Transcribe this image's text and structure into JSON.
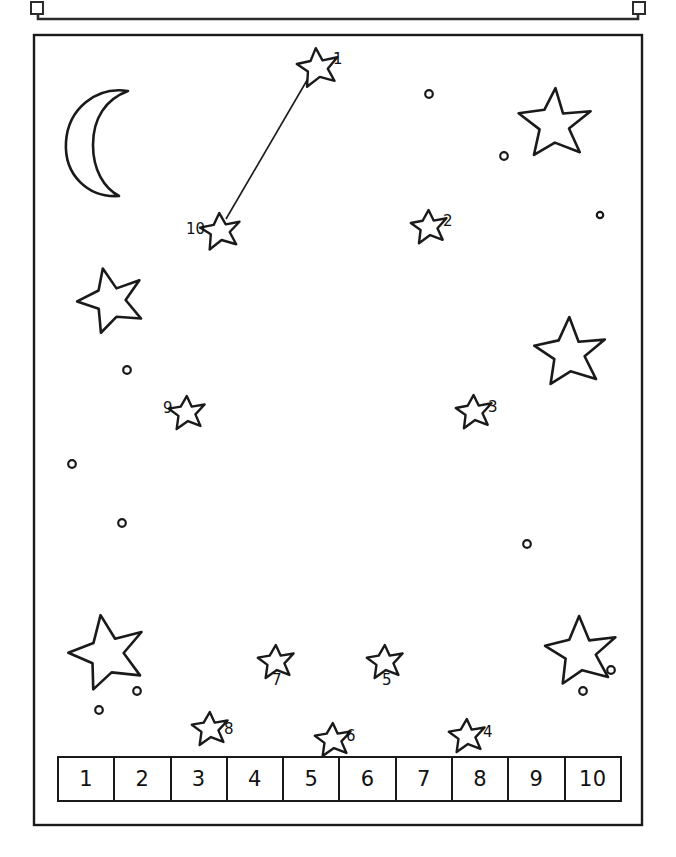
{
  "page": {
    "kind": "connect-the-dots-worksheet",
    "background_color": "#ffffff",
    "ink_color": "#1a1a1a",
    "top_partial_frame": {
      "visible": true,
      "description": "cut-off rectangle edge with small square corner brackets"
    },
    "worksheet_border": {
      "x": 33,
      "y": 34,
      "width": 610,
      "height": 792
    }
  },
  "decorations": {
    "moon": {
      "name": "crescent-moon",
      "cx": 100,
      "cy": 143
    },
    "big_stars": [
      {
        "cx": 550,
        "cy": 120,
        "r": 34
      },
      {
        "cx": 106,
        "cy": 296,
        "r": 30
      },
      {
        "cx": 566,
        "cy": 347,
        "r": 32
      },
      {
        "cx": 103,
        "cy": 646,
        "r": 33
      },
      {
        "cx": 577,
        "cy": 645,
        "r": 31
      }
    ],
    "dots": [
      {
        "cx": 429,
        "cy": 94,
        "r": 4
      },
      {
        "cx": 504,
        "cy": 156,
        "r": 4
      },
      {
        "cx": 600,
        "cy": 215,
        "r": 3.5
      },
      {
        "cx": 127,
        "cy": 370,
        "r": 4
      },
      {
        "cx": 72,
        "cy": 464,
        "r": 4
      },
      {
        "cx": 122,
        "cy": 523,
        "r": 4
      },
      {
        "cx": 527,
        "cy": 544,
        "r": 4
      },
      {
        "cx": 137,
        "cy": 691,
        "r": 4
      },
      {
        "cx": 99,
        "cy": 710,
        "r": 4
      },
      {
        "cx": 611,
        "cy": 670,
        "r": 4
      },
      {
        "cx": 583,
        "cy": 691,
        "r": 4
      }
    ]
  },
  "puzzle": {
    "instruction_line_drawn": true,
    "connector_from": 10,
    "connector_to": 1,
    "dots": [
      {
        "n": "1",
        "sx": 318,
        "sy": 62,
        "sr": 15,
        "lx": 333,
        "ly": 52
      },
      {
        "n": "2",
        "sx": 430,
        "sy": 222,
        "sr": 13,
        "lx": 443,
        "ly": 216
      },
      {
        "n": "3",
        "sx": 475,
        "sy": 407,
        "sr": 13,
        "lx": 488,
        "ly": 402
      },
      {
        "n": "4",
        "sx": 468,
        "sy": 731,
        "sr": 13,
        "lx": 483,
        "ly": 727
      },
      {
        "n": "5",
        "sx": 386,
        "sy": 657,
        "sr": 13,
        "lx": 382,
        "ly": 673
      },
      {
        "n": "6",
        "sx": 334,
        "sy": 735,
        "sr": 13,
        "lx": 346,
        "ly": 732
      },
      {
        "n": "7",
        "sx": 277,
        "sy": 657,
        "sr": 13,
        "lx": 273,
        "ly": 673
      },
      {
        "n": "8",
        "sx": 211,
        "sy": 724,
        "sr": 13,
        "lx": 224,
        "ly": 724
      },
      {
        "n": "9",
        "sx": 188,
        "sy": 408,
        "sr": 13,
        "lx": 168,
        "ly": 403
      },
      {
        "n": "10",
        "sx": 221,
        "sy": 226,
        "sr": 14,
        "lx": 189,
        "ly": 222
      }
    ]
  },
  "number_strip": {
    "cells": [
      "1",
      "2",
      "3",
      "4",
      "5",
      "6",
      "7",
      "8",
      "9",
      "10"
    ]
  }
}
